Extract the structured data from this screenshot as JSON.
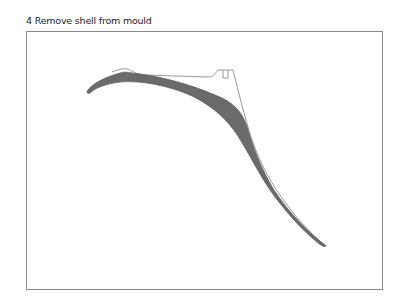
{
  "figure": {
    "step_number": "4",
    "title": "4 Remove shell from mould",
    "elements": [
      {
        "name": "shell",
        "description": "curved shell cross-section, shaded"
      },
      {
        "name": "mould",
        "description": "outline of mould profile with notch"
      }
    ],
    "colors": {
      "shell_fill": "#6b6b6b",
      "mould_stroke": "#8c8c8c",
      "frame_stroke": "#8a8a8a",
      "text": "#222222"
    }
  }
}
